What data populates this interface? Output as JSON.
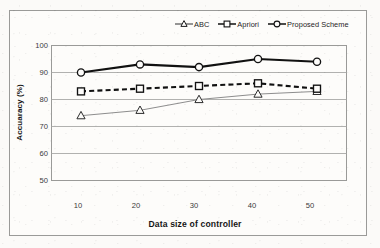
{
  "chart_data": {
    "type": "line",
    "title": "",
    "xlabel": "Data size of controller",
    "ylabel": "Accuaracy (%)",
    "categories": [
      10,
      20,
      30,
      40,
      50
    ],
    "x": [
      10,
      20,
      30,
      40,
      50
    ],
    "xlim": [
      5,
      55
    ],
    "ylim": [
      50,
      100
    ],
    "ytick_labels": [
      "100",
      "90",
      "80",
      "70",
      "60",
      "50"
    ],
    "yticks": [
      100,
      90,
      80,
      70,
      60,
      50
    ],
    "xtick_labels": [
      "10",
      "20",
      "30",
      "40",
      "50"
    ],
    "grid": "horizontal",
    "legend_position": "top-right",
    "series": [
      {
        "name": "ABC",
        "marker": "triangle",
        "line_style": "solid-thin",
        "color": "#8d8d8d",
        "values": [
          74,
          76,
          80,
          82,
          83
        ]
      },
      {
        "name": "Apriori",
        "marker": "square",
        "line_style": "dashed-thick",
        "color": "#111111",
        "values": [
          83,
          84,
          85,
          86,
          84
        ]
      },
      {
        "name": "Proposed Scheme",
        "marker": "circle",
        "line_style": "solid-thick",
        "color": "#111111",
        "values": [
          90,
          93,
          92,
          95,
          94
        ]
      }
    ]
  },
  "legend": {
    "items": [
      {
        "label": "ABC",
        "glyph": "triangle-marker-icon"
      },
      {
        "label": "Apriori",
        "glyph": "square-marker-icon"
      },
      {
        "label": "Proposed Scheme",
        "glyph": "circle-marker-icon"
      }
    ]
  },
  "axes": {
    "y_title": "Accuaracy (%)",
    "x_title": "Data size of controller",
    "y_ticks": [
      "100",
      "90",
      "80",
      "70",
      "60",
      "50"
    ],
    "x_ticks": [
      "10",
      "20",
      "30",
      "40",
      "50"
    ]
  },
  "colors": {
    "plot_background": "#fdfcfa",
    "page_background": "#fbfaf8",
    "border": "#9a9a98",
    "gridline": "#a8a8a6",
    "series_dark": "#111111",
    "series_gray": "#8d8d8d"
  }
}
